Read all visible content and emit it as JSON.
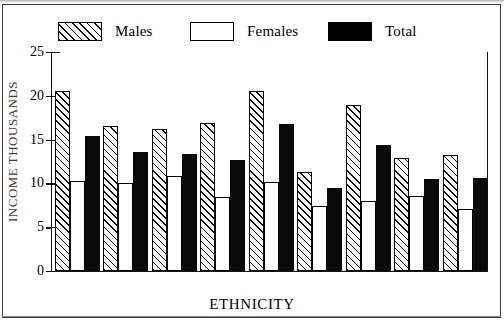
{
  "figure": {
    "xlabel": "ETHNICITY",
    "ylabel": "INCOME THOUSANDS",
    "ylabel_note": "clipped at left edge of scan"
  },
  "legend": {
    "position": "top",
    "items": [
      {
        "label": "Males",
        "pattern": "diagonal-hatch",
        "icon": "hatched-swatch-icon"
      },
      {
        "label": "Females",
        "pattern": "dotted-stipple",
        "icon": "dotted-swatch-icon"
      },
      {
        "label": "Total",
        "pattern": "solid-black",
        "icon": "solid-swatch-icon"
      }
    ]
  },
  "axis": {
    "y_ticks": [
      "25",
      "20",
      "15",
      "10",
      "5",
      "0"
    ],
    "y_min": 0,
    "y_max": 25
  },
  "chart_data": {
    "type": "bar",
    "title": "",
    "xlabel": "ETHNICITY",
    "ylabel": "INCOME THOUSANDS",
    "ylim": [
      0,
      25
    ],
    "yticks": [
      0,
      5,
      10,
      15,
      20,
      25
    ],
    "grid": false,
    "legend_position": "top",
    "categories": [
      "Japanese",
      "Chinese",
      "Filipino",
      "Korean",
      "A.Indian",
      "Vietnam.",
      "White",
      "Black",
      "Hispanic"
    ],
    "series": [
      {
        "name": "Males",
        "values": [
          20.6,
          16.5,
          16.2,
          16.9,
          20.5,
          11.3,
          18.9,
          12.9,
          13.3
        ]
      },
      {
        "name": "Females",
        "values": [
          10.3,
          10.1,
          10.9,
          8.5,
          10.2,
          7.4,
          8.0,
          8.6,
          7.1
        ]
      },
      {
        "name": "Total",
        "values": [
          15.4,
          13.6,
          13.4,
          12.7,
          16.8,
          9.5,
          14.4,
          10.5,
          10.6
        ]
      }
    ]
  }
}
